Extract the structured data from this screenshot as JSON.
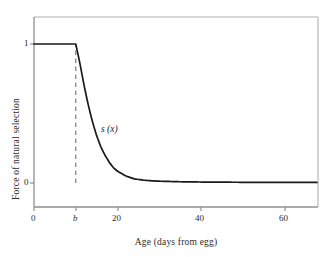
{
  "chart_data": {
    "type": "line",
    "title": "",
    "xlabel": "Age (days from egg)",
    "ylabel": "Force of natural selection",
    "xlim": [
      0,
      68
    ],
    "ylim": [
      -0.04,
      1.18
    ],
    "grid": false,
    "legend": "none",
    "xticks": [
      {
        "value": 0,
        "label": "0",
        "italic": false
      },
      {
        "value": 10,
        "label": "b",
        "italic": true
      },
      {
        "value": 20,
        "label": "20",
        "italic": false
      },
      {
        "value": 40,
        "label": "40",
        "italic": false
      },
      {
        "value": 60,
        "label": "60",
        "italic": false
      }
    ],
    "yticks": [
      {
        "value": 0,
        "label": "0"
      },
      {
        "value": 1,
        "label": "1"
      }
    ],
    "annotations": [
      {
        "text": "s (x)",
        "x": 17,
        "y": 0.43,
        "italic": true
      }
    ],
    "series": [
      {
        "name": "s (x)",
        "style": "solid",
        "color": "#1a1a1a",
        "description": "Force of natural selection: constant at 1 until age b, then exponential decay toward 0",
        "x": [
          0,
          2,
          4,
          6,
          8,
          10,
          11,
          12,
          13,
          14,
          15,
          16,
          17,
          18,
          19,
          20,
          22,
          24,
          26,
          28,
          30,
          35,
          40,
          45,
          50,
          55,
          60,
          65,
          68
        ],
        "y": [
          1,
          1,
          1,
          1,
          1,
          1,
          0.86,
          0.7,
          0.56,
          0.44,
          0.34,
          0.26,
          0.2,
          0.15,
          0.11,
          0.085,
          0.05,
          0.03,
          0.021,
          0.016,
          0.013,
          0.009,
          0.007,
          0.006,
          0.005,
          0.005,
          0.004,
          0.004,
          0.004
        ]
      },
      {
        "name": "b-marker",
        "style": "dashed",
        "color": "#7a7a7a",
        "description": "Vertical dashed reference line at age b",
        "x": [
          10,
          10
        ],
        "y": [
          0,
          1
        ]
      }
    ]
  },
  "frame": {
    "border_color": "#a8a8a8",
    "axis_color": "#8f8f8f"
  }
}
